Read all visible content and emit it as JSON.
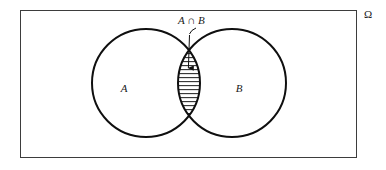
{
  "figure": {
    "type": "venn-diagram",
    "background_color": "#ffffff",
    "stroke_color": "#111111",
    "hatch_color": "#333333",
    "universe": {
      "label": "Ω",
      "label_name": "omega",
      "rect": {
        "x": 20,
        "y": 10,
        "width": 337,
        "height": 148
      },
      "label_position": {
        "x": 368,
        "y": 17
      },
      "stroke_width": 1
    },
    "sets": [
      {
        "id": "A",
        "label": "A",
        "center": {
          "x": 146,
          "y": 83
        },
        "radius": 54,
        "label_position": {
          "x": 124,
          "y": 92
        },
        "stroke_width": 2
      },
      {
        "id": "B",
        "label": "B",
        "center": {
          "x": 232,
          "y": 83
        },
        "radius": 54,
        "label_position": {
          "x": 237,
          "y": 92
        },
        "stroke_width": 2
      }
    ],
    "intersection": {
      "label": "A ∩ B",
      "label_parts": {
        "left": "A",
        "operator": "∩",
        "right": "B"
      },
      "label_position": {
        "x": 178,
        "y": 24
      },
      "shaded": true,
      "hatch_pattern": "horizontal-lines",
      "hatch_spacing_px": 4,
      "top_point": {
        "x": 189,
        "y": 33
      },
      "bottom_point": {
        "x": 189,
        "y": 131
      }
    },
    "annotation_arrow": {
      "name": "intersection-pointer",
      "leader_from": {
        "x": 184,
        "y": 27
      },
      "leader_to": {
        "x": 189,
        "y": 34
      },
      "arrow_from": {
        "x": 189,
        "y": 36
      },
      "arrow_to": {
        "x": 188,
        "y": 73
      },
      "head_style": "filled-triangle"
    }
  }
}
